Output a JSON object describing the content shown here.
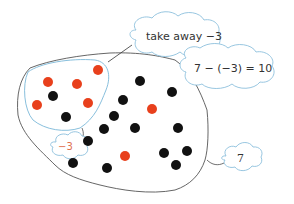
{
  "diagram": {
    "colors": {
      "red": "#e8401c",
      "black": "#111111",
      "outline": "#555555",
      "group_outline": "#7ab8d8",
      "cloud_outline": "#8cc0dc",
      "minus3_text": "#e07050"
    },
    "labels": {
      "take_away": "take away −3",
      "equation": "7 − (−3) = 10",
      "group_label": "−3",
      "total_label": "7"
    },
    "dots": {
      "red": [
        {
          "x": 98,
          "y": 70
        },
        {
          "x": 48,
          "y": 82
        },
        {
          "x": 77,
          "y": 84
        },
        {
          "x": 37,
          "y": 105
        },
        {
          "x": 88,
          "y": 103
        },
        {
          "x": 152,
          "y": 109
        },
        {
          "x": 125,
          "y": 156
        }
      ],
      "black": [
        {
          "x": 53,
          "y": 96
        },
        {
          "x": 66,
          "y": 117
        },
        {
          "x": 140,
          "y": 81
        },
        {
          "x": 172,
          "y": 92
        },
        {
          "x": 123,
          "y": 100
        },
        {
          "x": 114,
          "y": 116
        },
        {
          "x": 104,
          "y": 129
        },
        {
          "x": 135,
          "y": 128
        },
        {
          "x": 88,
          "y": 141
        },
        {
          "x": 178,
          "y": 128
        },
        {
          "x": 187,
          "y": 151
        },
        {
          "x": 164,
          "y": 153
        },
        {
          "x": 107,
          "y": 168
        },
        {
          "x": 176,
          "y": 165
        },
        {
          "x": 73,
          "y": 163
        }
      ]
    }
  }
}
